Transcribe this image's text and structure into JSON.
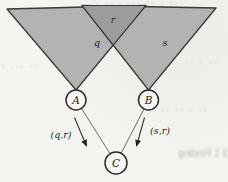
{
  "diagram": {
    "regions": [
      {
        "id": "q",
        "label": "q"
      },
      {
        "id": "r",
        "label": "r"
      },
      {
        "id": "s",
        "label": "s"
      }
    ],
    "nodes": [
      {
        "id": "A",
        "label": "A"
      },
      {
        "id": "B",
        "label": "B"
      },
      {
        "id": "C",
        "label": "C"
      }
    ],
    "edges": [
      {
        "from": "A",
        "to": "C",
        "label": "(q,r)"
      },
      {
        "from": "B",
        "to": "C",
        "label": "(s,r)"
      }
    ],
    "colors": {
      "triangle_fill": "#b3b3b3",
      "overlap_fill": "#9c9c9c",
      "stroke": "#3a3a3a",
      "node_fill": "#f7f6f3",
      "background": "#f6f4f1"
    }
  },
  "bleedthrough": {
    "bottom_text": "3 1  Finding",
    "noise_a": "▪ ▪▪ ▪ ▪▪▪ ▪▪ ▪ ▪▪",
    "noise_b": "▪▪ ▪ ▪▪",
    "noise_c": "▪ ▪▪▪ ▪▪",
    "noise_d": "▪▪ ▪▪ ▪ ▪▪"
  }
}
